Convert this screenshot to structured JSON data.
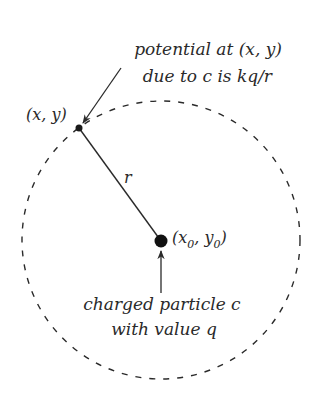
{
  "diagram": {
    "type": "physics-schematic",
    "colors": {
      "background": "#ffffff",
      "ink": "#2a2a2a"
    },
    "annotation_top": {
      "line1": "potential at (x, y)",
      "line2": "due to c is kq/r"
    },
    "point_label": {
      "open": "(",
      "x": "x",
      "sep": ", ",
      "y": "y",
      "close": ")"
    },
    "center_label": {
      "open": "(",
      "x": "x",
      "x_sub": "0",
      "sep": ", ",
      "y": "y",
      "y_sub": "0",
      "close": ")"
    },
    "radius_label": "r",
    "annotation_bottom": {
      "line1": "charged particle c",
      "line2": "with value q"
    }
  }
}
